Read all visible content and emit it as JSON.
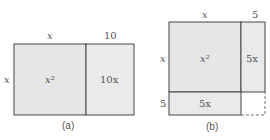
{
  "figure_a": {
    "top_left_label": "x",
    "top_right_label": "10",
    "side_label": "x",
    "big_cell": "x²",
    "right_cell": "10x",
    "caption": "(a)"
  },
  "figure_b": {
    "top_left_label": "x",
    "top_right_label": "5",
    "side_top_label": "x",
    "side_bottom_label": "5",
    "big_cell": "x²",
    "right_cell": "5x",
    "bottom_cell": "5x",
    "caption": "(b)"
  },
  "colors": {
    "fill": "#e6e6e6",
    "stroke": "#444444",
    "dashed": "#777777"
  }
}
